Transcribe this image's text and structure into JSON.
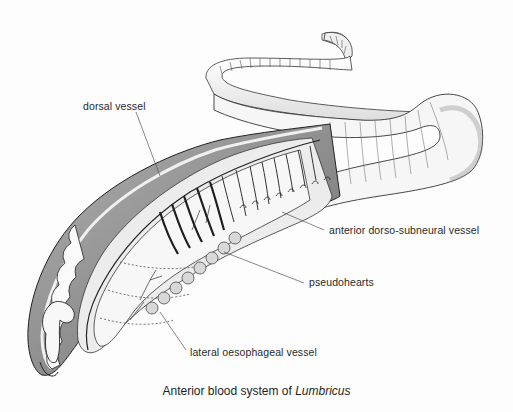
{
  "figure": {
    "caption_prefix": "Anterior blood system of ",
    "caption_genus": "Lumbricus",
    "labels": [
      {
        "id": "dorsal",
        "text": "dorsal vessel",
        "x": 83,
        "y": 100
      },
      {
        "id": "dorso-subneural",
        "text": "anterior dorso-subneural vessel",
        "x": 329,
        "y": 224
      },
      {
        "id": "pseudohearts",
        "text": "pseudohearts",
        "x": 309,
        "y": 276
      },
      {
        "id": "lateral",
        "text": "lateral oesophageal vessel",
        "x": 190,
        "y": 346
      }
    ]
  },
  "colors": {
    "ink": "#222222",
    "body_shade": "#8a8a8a",
    "body_light": "#e4e4e4",
    "interior": "#f2f2f2"
  }
}
